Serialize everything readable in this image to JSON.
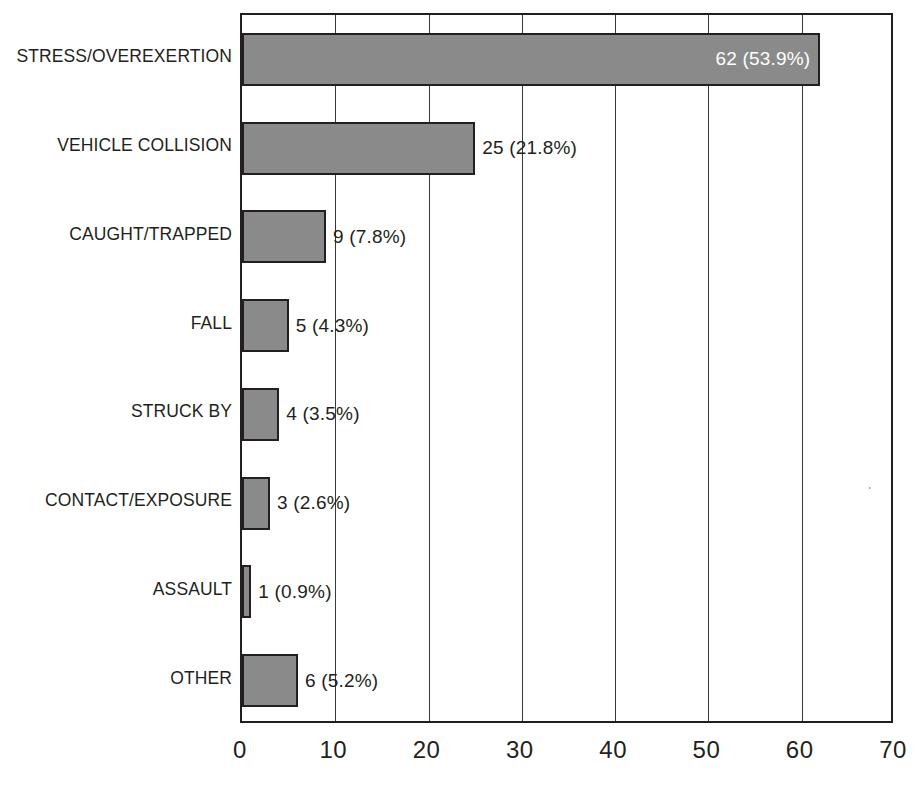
{
  "chart_data": {
    "type": "bar",
    "orientation": "horizontal",
    "title": "",
    "subtitle": "",
    "xlabel": "",
    "ylabel": "",
    "xlim": [
      0,
      70
    ],
    "xticks": [
      0,
      10,
      20,
      30,
      40,
      50,
      60,
      70
    ],
    "xtick_labels": [
      "0",
      "10",
      "20",
      "30",
      "40",
      "50",
      "60",
      "70"
    ],
    "grid": "vertical",
    "legend": "none",
    "bar_color": "#8a8a8a",
    "bar_border_color": "#231f20",
    "axis_color": "#231f20",
    "categories": [
      "STRESS/OVEREXERTION",
      "VEHICLE COLLISION",
      "CAUGHT/TRAPPED",
      "FALL",
      "STRUCK BY",
      "CONTACT/EXPOSURE",
      "ASSAULT",
      "OTHER"
    ],
    "values": [
      62,
      25,
      9,
      5,
      4,
      3,
      1,
      6
    ],
    "percents": [
      "53.9%",
      "21.8%",
      "7.8%",
      "4.3%",
      "3.5%",
      "2.6%",
      "0.9%",
      "5.2%"
    ],
    "data_labels": [
      "62 (53.9%)",
      "25 (21.8%)",
      "9 (7.8%)",
      "5 (4.3%)",
      "4 (3.5%)",
      "3 (2.6%)",
      "1 (0.9%)",
      "6 (5.2%)"
    ],
    "data_label_placement": [
      "inside",
      "outside",
      "outside",
      "outside",
      "outside",
      "outside",
      "outside",
      "outside"
    ],
    "data_label_colors": [
      "#ffffff",
      "#231f20",
      "#231f20",
      "#231f20",
      "#231f20",
      "#231f20",
      "#231f20",
      "#231f20"
    ],
    "total": 115
  }
}
